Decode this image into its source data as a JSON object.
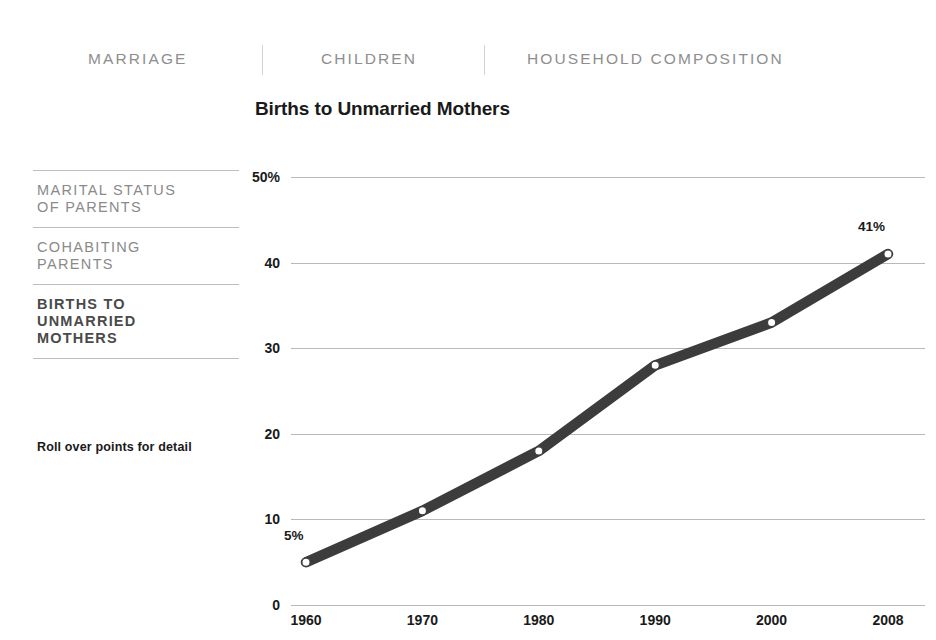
{
  "topnav": {
    "tabs": [
      {
        "label": "MARRIAGE"
      },
      {
        "label": "CHILDREN"
      },
      {
        "label": "HOUSEHOLD COMPOSITION"
      }
    ]
  },
  "sidebar": {
    "items": [
      {
        "label": "MARITAL STATUS\nOF PARENTS",
        "active": false
      },
      {
        "label": "COHABITING\nPARENTS",
        "active": false
      },
      {
        "label": "BIRTHS TO\nUNMARRIED\nMOTHERS",
        "active": true
      }
    ],
    "note": "Roll over points for detail"
  },
  "colors": {
    "line": "#3c3c3c",
    "grid": "#b9b9b9",
    "tab_text": "#8e8e8e",
    "sidebar_text": "#8a8a8a",
    "sidebar_active_text": "#4a4a4a",
    "marker_fill": "#ffffff"
  },
  "chart_data": {
    "type": "line",
    "title": "Births to Unmarried Mothers",
    "xlabel": "",
    "ylabel": "",
    "x": [
      1960,
      1970,
      1980,
      1990,
      2000,
      2008
    ],
    "categories": [
      "1960",
      "1970",
      "1980",
      "1990",
      "2000",
      "2008"
    ],
    "values": [
      5,
      11,
      18,
      28,
      33,
      41
    ],
    "series": [
      {
        "name": "Births to Unmarried Mothers",
        "values": [
          5,
          11,
          18,
          28,
          33,
          41
        ]
      }
    ],
    "ylim": [
      0,
      50
    ],
    "yticks": [
      0,
      10,
      20,
      30,
      40,
      50
    ],
    "ytick_labels": [
      "0",
      "10",
      "20",
      "30",
      "40",
      "50%"
    ],
    "grid": true,
    "legend": "none",
    "annotations": [
      {
        "text": "5%",
        "x": 1960,
        "y": 5
      },
      {
        "text": "41%",
        "x": 2008,
        "y": 41
      }
    ]
  }
}
